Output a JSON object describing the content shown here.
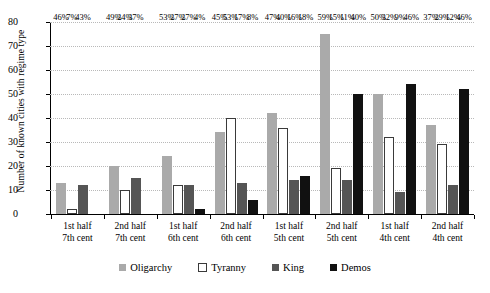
{
  "chart_data": {
    "type": "bar",
    "title": "",
    "xlabel": "",
    "ylabel": "Number of known cities with regime type",
    "ylim": [
      0,
      80
    ],
    "yticks": [
      0,
      10,
      20,
      30,
      40,
      50,
      60,
      70,
      80
    ],
    "grid": true,
    "legend_position": "bottom",
    "categories": [
      "1st half 7th cent",
      "2nd half 7th cent",
      "1st half 6th cent",
      "2nd half 6th cent",
      "1st half 5th cent",
      "2nd half 5th cent",
      "1st half 4th cent",
      "2nd half 4th cent"
    ],
    "category_lines": [
      [
        "1st half",
        "7th cent"
      ],
      [
        "2nd half",
        "7th cent"
      ],
      [
        "1st half",
        "6th cent"
      ],
      [
        "2nd half",
        "6th cent"
      ],
      [
        "1st half",
        "5th cent"
      ],
      [
        "2nd half",
        "5th cent"
      ],
      [
        "1st half",
        "4th cent"
      ],
      [
        "2nd half",
        "4th cent"
      ]
    ],
    "series": [
      {
        "name": "Oligarchy",
        "color": "#aaaaaa",
        "values": [
          13,
          20,
          24,
          34,
          42,
          75,
          50,
          37
        ],
        "labels": [
          "46%",
          "49%",
          "53%",
          "45%",
          "47%",
          "59%",
          "50%",
          "37%"
        ]
      },
      {
        "name": "Tyranny",
        "color": "#ffffff",
        "values": [
          2,
          10,
          12,
          40,
          36,
          19,
          32,
          29
        ],
        "labels": [
          "7%",
          "24%",
          "27%",
          "53%",
          "40%",
          "15%",
          "32%",
          "29%"
        ]
      },
      {
        "name": "King",
        "color": "#555555",
        "values": [
          12,
          15,
          12,
          13,
          14,
          14,
          9,
          12
        ],
        "labels": [
          "43%",
          "37%",
          "27%",
          "17%",
          "16%",
          "11%",
          "9%",
          "12%"
        ]
      },
      {
        "name": "Demos",
        "color": "#111111",
        "values": [
          0,
          0,
          2,
          6,
          16,
          50,
          54,
          52
        ],
        "labels": [
          "",
          "",
          "4%",
          "8%",
          "18%",
          "40%",
          "46%",
          "46%"
        ]
      }
    ]
  },
  "legend": {
    "items": [
      {
        "label": "Oligarchy",
        "key": "oligarchy"
      },
      {
        "label": "Tyranny",
        "key": "tyranny"
      },
      {
        "label": "King",
        "key": "king"
      },
      {
        "label": "Demos",
        "key": "demos"
      }
    ]
  }
}
